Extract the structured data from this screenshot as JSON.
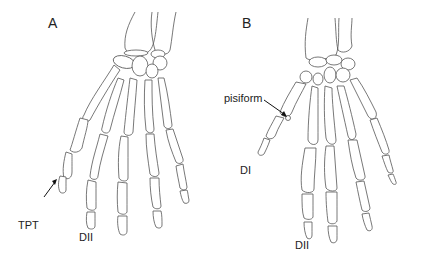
{
  "figure": {
    "type": "anatomical line drawing",
    "panels": [
      {
        "id": "A",
        "label": "A",
        "annotations": [
          {
            "text": "TPT",
            "has_arrow": true
          },
          {
            "text": "DII",
            "has_arrow": false
          }
        ]
      },
      {
        "id": "B",
        "label": "B",
        "annotations": [
          {
            "text": "pisiform",
            "has_arrow": true
          },
          {
            "text": "DI",
            "has_arrow": false
          },
          {
            "text": "DII",
            "has_arrow": false
          }
        ]
      }
    ],
    "colors": {
      "line": "#555555",
      "background": "#ffffff",
      "text": "#222222"
    }
  }
}
